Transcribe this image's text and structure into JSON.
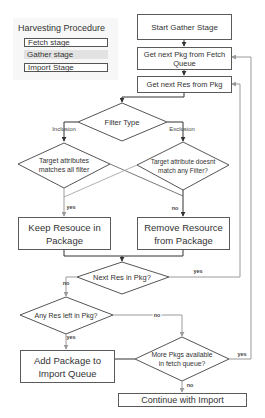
{
  "legend": {
    "title": "Harvesting Procedure",
    "items": [
      {
        "label": "Fetch stage",
        "style": "boxed"
      },
      {
        "label": "Gather stage",
        "style": "shaded"
      },
      {
        "label": "Import Stage",
        "style": "boxed"
      }
    ]
  },
  "nodes": {
    "start_gather": "Start Gather Stage",
    "get_next_pkg": "Get next Pkg from Fetch Queue",
    "get_next_res": "Get next Res from Pkg",
    "filter_type": "Filter Type",
    "inclusion_check": "Target attributes matches all filter",
    "exclusion_check": "Target attribute doesnt match any Filter?",
    "keep_resource": "Keep Resouce in Package",
    "remove_resource": "Remove Resource from Package",
    "next_res": "Next Res in Pkg?",
    "any_res_left": "Any Res left in Pkg?",
    "add_package": "Add Package to Import Queue",
    "more_pkgs": "More Pkgs available in fetch queue?",
    "continue_import": "Continue with Import"
  },
  "edge_labels": {
    "inclusion": "Inclusion",
    "exclusion": "Exclusion",
    "incl_yes": "yes",
    "excl_no": "no",
    "next_res_yes": "yes",
    "next_res_no": "no",
    "any_res_yes": "yes",
    "any_res_no": "no",
    "more_pkgs_yes": "yes",
    "more_pkgs_no": "no"
  },
  "colors": {
    "box_border": "#5a5a5a",
    "connector_dark": "#333333",
    "connector_light": "#9a9a9a",
    "legend_bg": "#f7f7f7",
    "legend_shaded": "#e2e2e2"
  }
}
